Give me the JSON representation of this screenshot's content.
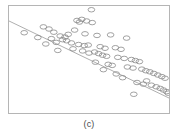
{
  "figure": {
    "caption": "(c)",
    "frame_color": "#b5b5b5",
    "background": "#ffffff"
  },
  "chart_data": {
    "type": "scatter",
    "title": "",
    "subtitle": "",
    "xlabel": "",
    "ylabel": "",
    "xlim": [
      0,
      100
    ],
    "ylim": [
      0,
      100
    ],
    "grid": false,
    "legend": null,
    "marker": {
      "shape": "circle-open",
      "color": "#8a8a8a",
      "size": 2.1
    },
    "annotations": [
      {
        "text": "outlier",
        "x": 51.5,
        "y": 96.5
      }
    ],
    "series": [
      {
        "name": "observations",
        "type": "scatter",
        "x": [
          51.5,
          42.5,
          45.5,
          48.5,
          44.0,
          52.0,
          21.5,
          41.0,
          9.5,
          47.5,
          37.0,
          18.0,
          26.5,
          32.0,
          35.0,
          55.0,
          63.5,
          73.5,
          23.0,
          29.5,
          39.0,
          43.5,
          47.0,
          49.5,
          57.0,
          60.0,
          66.5,
          70.0,
          50.0,
          53.5,
          56.0,
          58.5,
          61.0,
          30.5,
          68.0,
          72.0,
          76.5,
          79.0,
          81.5,
          62.0,
          64.5,
          74.0,
          77.5,
          83.0,
          85.5,
          88.0,
          90.5,
          93.0,
          95.5,
          97.5,
          86.0,
          80.0,
          84.0,
          89.0,
          92.0,
          94.5,
          96.5,
          98.5,
          99.5,
          78.0,
          71.0,
          67.0,
          59.0,
          54.0,
          46.0,
          36.0,
          28.0,
          25.0,
          33.5,
          40.0
        ],
        "y": [
          96.5,
          86.5,
          87.5,
          86.0,
          85.0,
          84.5,
          80.5,
          77.5,
          75.0,
          74.0,
          73.5,
          70.5,
          69.5,
          72.0,
          71.0,
          72.5,
          73.0,
          70.0,
          64.5,
          66.0,
          65.5,
          64.0,
          63.0,
          63.5,
          62.0,
          60.5,
          61.0,
          59.5,
          56.0,
          57.0,
          55.5,
          54.0,
          53.0,
          58.5,
          52.0,
          51.0,
          50.0,
          49.0,
          48.0,
          45.5,
          44.5,
          43.0,
          42.0,
          41.0,
          39.5,
          38.5,
          37.0,
          35.5,
          34.0,
          32.5,
          30.0,
          28.5,
          27.0,
          26.0,
          24.5,
          23.0,
          21.5,
          20.0,
          18.5,
          17.5,
          33.0,
          36.5,
          40.5,
          47.5,
          58.0,
          67.5,
          75.5,
          78.5,
          68.5,
          60.0
        ]
      },
      {
        "name": "fit-line",
        "type": "line",
        "x": [
          0,
          100
        ],
        "y": [
          86.0,
          14.0
        ],
        "color": "#9a9a9a",
        "width": 0.8
      }
    ]
  }
}
